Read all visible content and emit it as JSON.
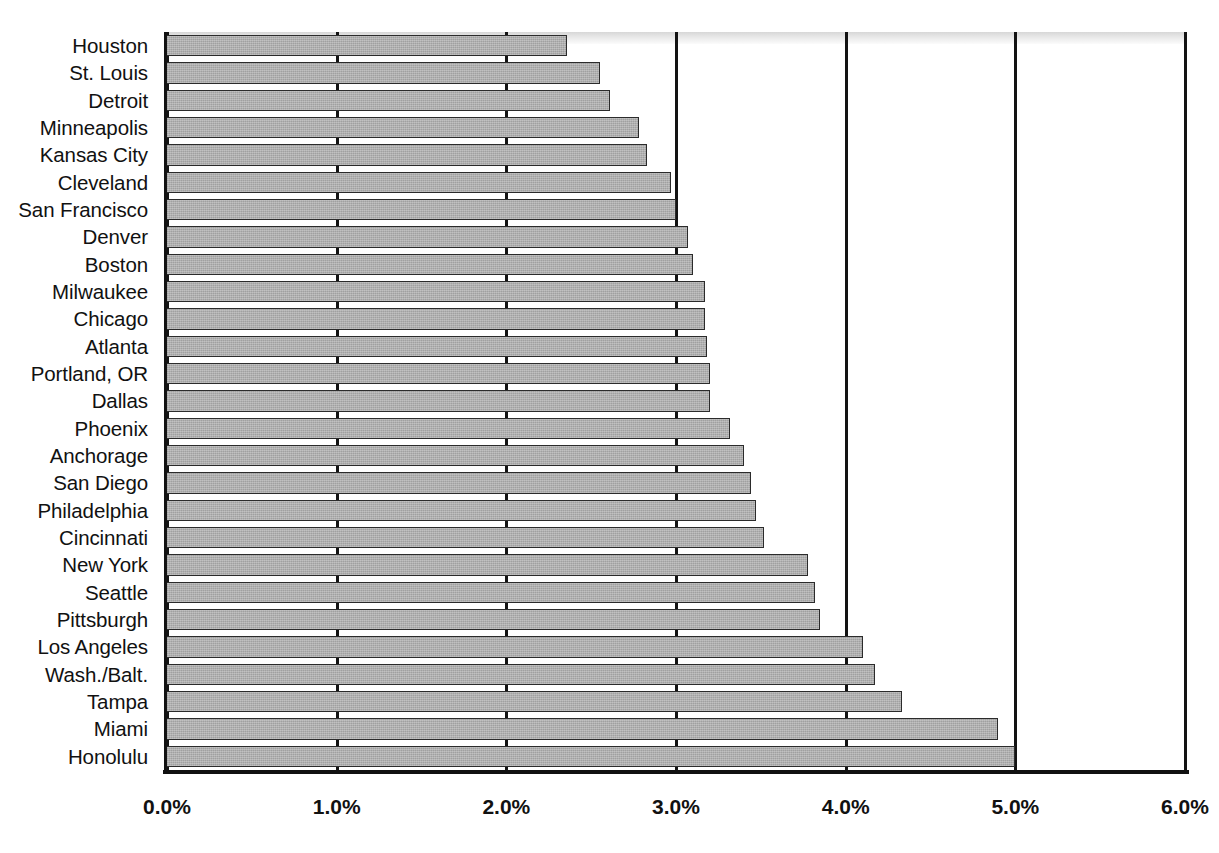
{
  "chart_data": {
    "type": "bar",
    "orientation": "horizontal",
    "title": "",
    "subtitle": "",
    "xlabel": "",
    "ylabel": "",
    "xlim": [
      0,
      6
    ],
    "xticks": [
      0,
      1,
      2,
      3,
      4,
      5,
      6
    ],
    "xtick_labels": [
      "0.0%",
      "1.0%",
      "2.0%",
      "3.0%",
      "4.0%",
      "5.0%",
      "6.0%"
    ],
    "grid": "vertical",
    "legend": "none",
    "value_unit": "%",
    "categories": [
      "Houston",
      "St. Louis",
      "Detroit",
      "Minneapolis",
      "Kansas City",
      "Cleveland",
      "San Francisco",
      "Denver",
      "Boston",
      "Milwaukee",
      "Chicago",
      "Atlanta",
      "Portland, OR",
      "Dallas",
      "Phoenix",
      "Anchorage",
      "San Diego",
      "Philadelphia",
      "Cincinnati",
      "New York",
      "Seattle",
      "Pittsburgh",
      "Los Angeles",
      "Wash./Balt.",
      "Tampa",
      "Miami",
      "Honolulu"
    ],
    "values": [
      2.36,
      2.55,
      2.61,
      2.78,
      2.83,
      2.97,
      3.0,
      3.07,
      3.1,
      3.17,
      3.17,
      3.18,
      3.2,
      3.2,
      3.32,
      3.4,
      3.44,
      3.47,
      3.52,
      3.78,
      3.82,
      3.85,
      4.1,
      4.17,
      4.33,
      4.9,
      5.0
    ],
    "bars": [
      {
        "label": "Houston",
        "value": 2.36
      },
      {
        "label": "St. Louis",
        "value": 2.55
      },
      {
        "label": "Detroit",
        "value": 2.61
      },
      {
        "label": "Minneapolis",
        "value": 2.78
      },
      {
        "label": "Kansas City",
        "value": 2.83
      },
      {
        "label": "Cleveland",
        "value": 2.97
      },
      {
        "label": "San Francisco",
        "value": 3.0
      },
      {
        "label": "Denver",
        "value": 3.07
      },
      {
        "label": "Boston",
        "value": 3.1
      },
      {
        "label": "Milwaukee",
        "value": 3.17
      },
      {
        "label": "Chicago",
        "value": 3.17
      },
      {
        "label": "Atlanta",
        "value": 3.18
      },
      {
        "label": "Portland, OR",
        "value": 3.2
      },
      {
        "label": "Dallas",
        "value": 3.2
      },
      {
        "label": "Phoenix",
        "value": 3.32
      },
      {
        "label": "Anchorage",
        "value": 3.4
      },
      {
        "label": "San Diego",
        "value": 3.44
      },
      {
        "label": "Philadelphia",
        "value": 3.47
      },
      {
        "label": "Cincinnati",
        "value": 3.52
      },
      {
        "label": "New York",
        "value": 3.78
      },
      {
        "label": "Seattle",
        "value": 3.82
      },
      {
        "label": "Pittsburgh",
        "value": 3.85
      },
      {
        "label": "Los Angeles",
        "value": 4.1
      },
      {
        "label": "Wash./Balt.",
        "value": 4.17
      },
      {
        "label": "Tampa",
        "value": 4.33
      },
      {
        "label": "Miami",
        "value": 4.9
      },
      {
        "label": "Honolulu",
        "value": 5.0
      }
    ],
    "colors": {
      "bar_fill": "#a9a9a9",
      "bar_edge": "#2b2b2b",
      "axis": "#111111",
      "gridline": "#131313",
      "background": "#ffffff",
      "text": "#111111"
    }
  }
}
